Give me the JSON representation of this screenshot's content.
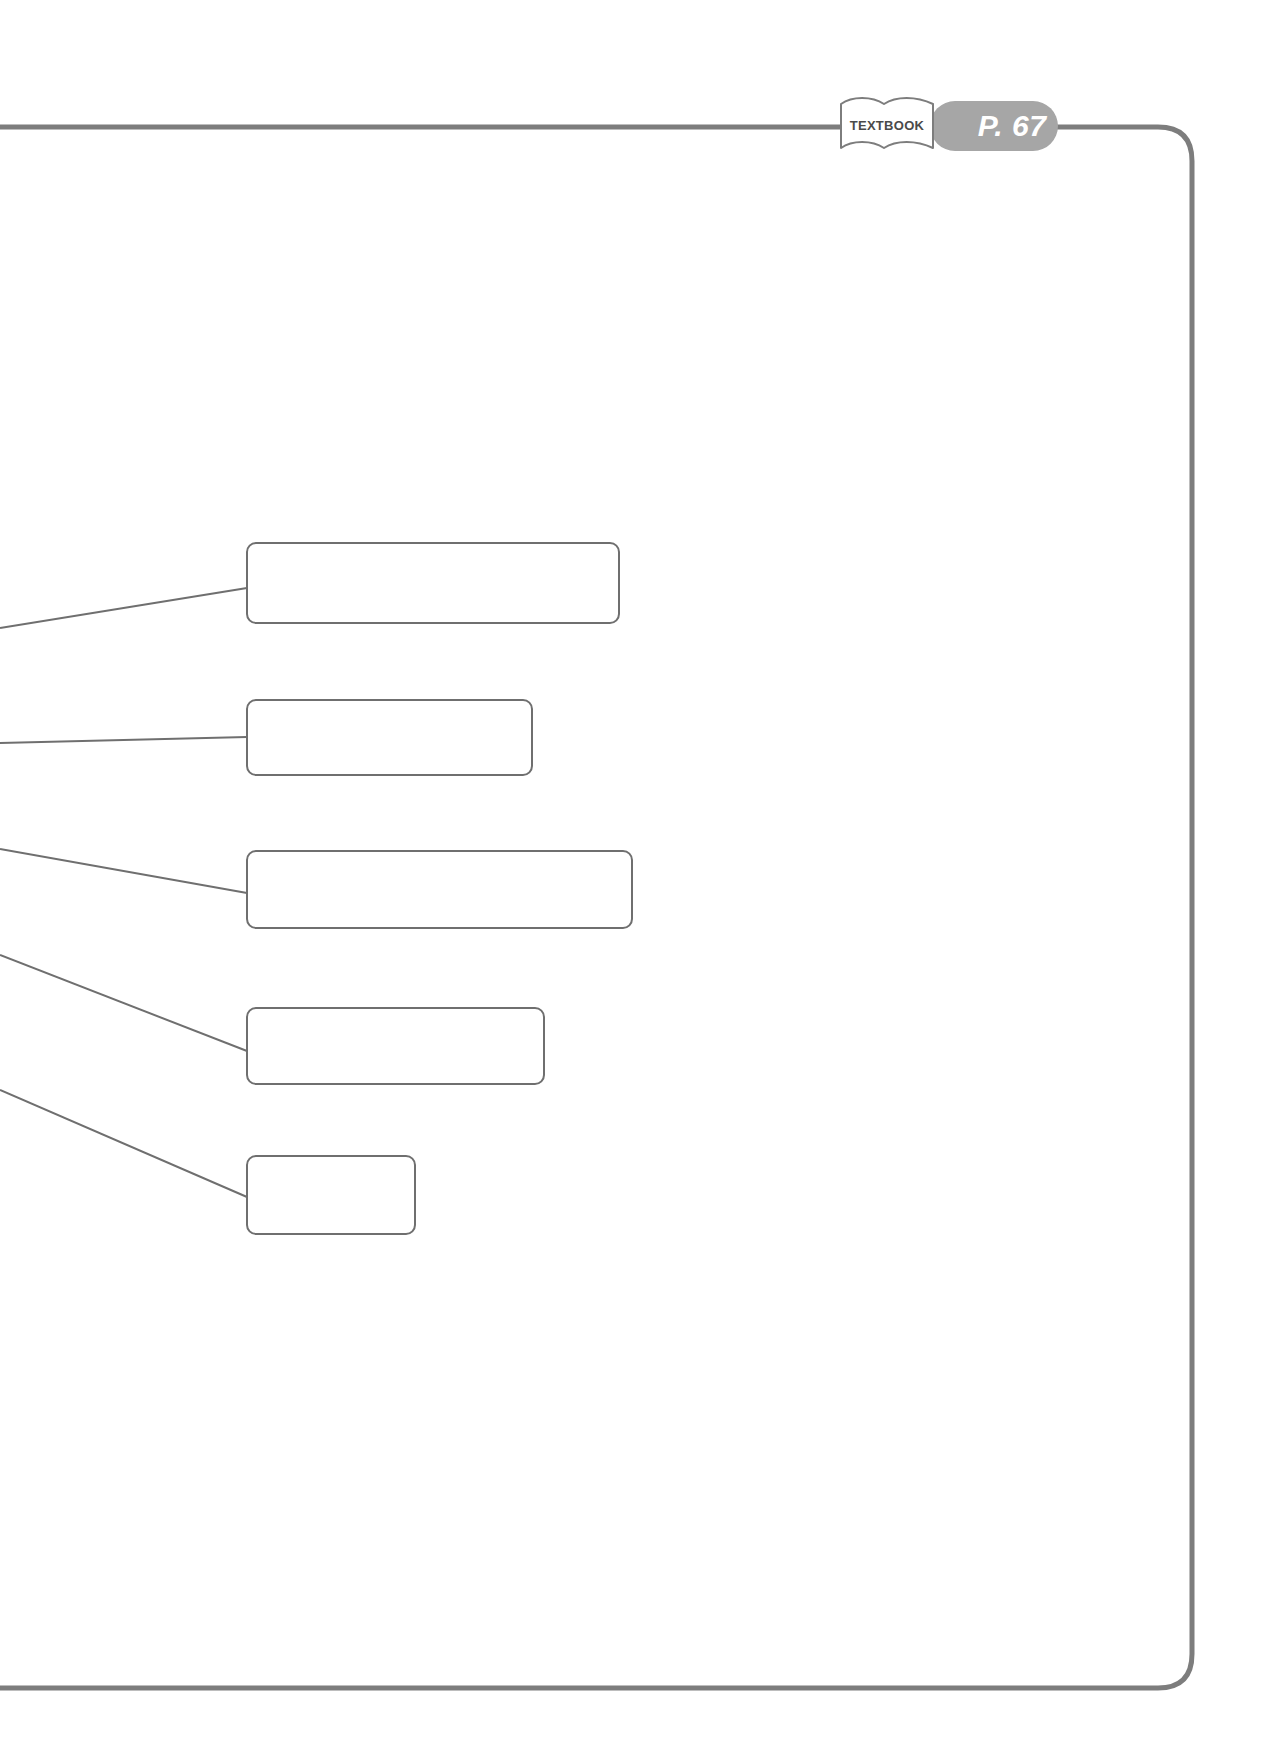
{
  "page": {
    "width": 1277,
    "height": 1746,
    "background": "#ffffff",
    "type": "worksheet-answer-page"
  },
  "colors": {
    "frame_line": "#7d7d7d",
    "box_outline": "#6f6f6f",
    "connector_line": "#6f6f6f",
    "pill_background": "#a6a6a6",
    "pill_text": "#ffffff",
    "tag_outline": "#7d7d7d",
    "tag_fill": "#ffffff",
    "tag_text": "#4a4a4a"
  },
  "header": {
    "textbook_tag": {
      "icon": "open-book-icon",
      "label": "TEXTBOOK"
    },
    "page_reference": {
      "label": "P. 67"
    },
    "rule_line": {
      "visible": true,
      "y": 127
    }
  },
  "frame": {
    "style": "rounded-right-border",
    "corner_radius": 34,
    "stroke_width": 5,
    "top_y": 127,
    "right_x": 1192,
    "bottom_y": 1688
  },
  "answer_boxes": [
    {
      "id": 1,
      "label": "",
      "value": "",
      "x": 247,
      "y": 543,
      "width": 372,
      "height": 80
    },
    {
      "id": 2,
      "label": "",
      "value": "",
      "x": 247,
      "y": 700,
      "width": 285,
      "height": 75
    },
    {
      "id": 3,
      "label": "",
      "value": "",
      "x": 247,
      "y": 851,
      "width": 385,
      "height": 77
    },
    {
      "id": 4,
      "label": "",
      "value": "",
      "x": 247,
      "y": 1008,
      "width": 297,
      "height": 76
    },
    {
      "id": 5,
      "label": "",
      "value": "",
      "x": 247,
      "y": 1156,
      "width": 168,
      "height": 78
    }
  ],
  "connectors": [
    {
      "id": 1,
      "from": {
        "x": 0,
        "y": 628
      },
      "to": {
        "x": 247,
        "y": 588
      }
    },
    {
      "id": 2,
      "from": {
        "x": 0,
        "y": 743
      },
      "to": {
        "x": 247,
        "y": 737
      }
    },
    {
      "id": 3,
      "from": {
        "x": 0,
        "y": 849
      },
      "to": {
        "x": 247,
        "y": 893
      }
    },
    {
      "id": 4,
      "from": {
        "x": 0,
        "y": 955
      },
      "to": {
        "x": 247,
        "y": 1051
      }
    },
    {
      "id": 5,
      "from": {
        "x": 0,
        "y": 1090
      },
      "to": {
        "x": 247,
        "y": 1197
      }
    }
  ]
}
